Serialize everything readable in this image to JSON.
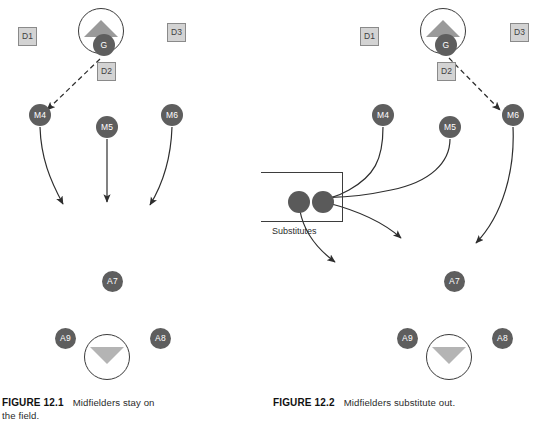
{
  "document": {
    "kind": "textbook-figure-pair",
    "colors": {
      "player_fill": "#5e5e5e",
      "player_text": "#ffffff",
      "dbox_fill": "#d3d3d3",
      "dbox_border": "#8a8a8a",
      "goal_outline": "#3b3b3b",
      "triangle_fill": "#9a9a9a",
      "arrow_stroke": "#2e2e2e",
      "background": "#ffffff"
    }
  },
  "figures": [
    {
      "id": "figure-12-1",
      "caption_number": "FIGURE 12.1",
      "caption_text": "Midfielders stay on",
      "caption_text_line2": "the field.",
      "defenders": [
        {
          "label": "D1",
          "x": 18,
          "y": 27
        },
        {
          "label": "D2",
          "x": 97,
          "y": 62
        },
        {
          "label": "D3",
          "x": 167,
          "y": 23
        }
      ],
      "goals": [
        {
          "name": "top-goal",
          "x": 78,
          "y": 8,
          "direction": "up"
        },
        {
          "name": "bottom-goal",
          "x": 84,
          "y": 334,
          "direction": "down"
        }
      ],
      "players": [
        {
          "label": "G",
          "x": 93,
          "y": 34,
          "d": 22
        },
        {
          "label": "M4",
          "x": 29,
          "y": 104,
          "d": 22
        },
        {
          "label": "M5",
          "x": 96,
          "y": 116,
          "d": 22
        },
        {
          "label": "M6",
          "x": 161,
          "y": 104,
          "d": 22
        },
        {
          "label": "A7",
          "x": 102,
          "y": 271,
          "d": 21
        },
        {
          "label": "A9",
          "x": 55,
          "y": 328,
          "d": 21
        },
        {
          "label": "A8",
          "x": 150,
          "y": 328,
          "d": 21
        }
      ],
      "dashed_pass": {
        "from": "G",
        "to": "M4"
      },
      "movement_arrows": [
        {
          "from": "M4",
          "direction": "curve-down-right"
        },
        {
          "from": "M5",
          "direction": "straight-down"
        },
        {
          "from": "M6",
          "direction": "curve-down-left"
        }
      ],
      "substitutes_box": null
    },
    {
      "id": "figure-12-2",
      "caption_number": "FIGURE 12.2",
      "caption_text": "Midfielders substitute out.",
      "caption_text_line2": "",
      "defenders": [
        {
          "label": "D1",
          "x": 89,
          "y": 27
        },
        {
          "label": "D2",
          "x": 166,
          "y": 62
        },
        {
          "label": "D3",
          "x": 239,
          "y": 23
        }
      ],
      "goals": [
        {
          "name": "top-goal",
          "x": 149,
          "y": 8,
          "direction": "up"
        },
        {
          "name": "bottom-goal",
          "x": 155,
          "y": 334,
          "direction": "down"
        }
      ],
      "players": [
        {
          "label": "G",
          "x": 164,
          "y": 34,
          "d": 22
        },
        {
          "label": "M4",
          "x": 101,
          "y": 104,
          "d": 22
        },
        {
          "label": "M5",
          "x": 168,
          "y": 116,
          "d": 22
        },
        {
          "label": "M6",
          "x": 231,
          "y": 104,
          "d": 22
        },
        {
          "label": "A7",
          "x": 173,
          "y": 271,
          "d": 21
        },
        {
          "label": "A9",
          "x": 126,
          "y": 328,
          "d": 21
        },
        {
          "label": "A8",
          "x": 221,
          "y": 328,
          "d": 21
        }
      ],
      "substitute_players": [
        {
          "label": "",
          "x": 17,
          "y": 191,
          "d": 22
        },
        {
          "label": "",
          "x": 41,
          "y": 191,
          "d": 22
        }
      ],
      "dashed_pass": {
        "from": "G",
        "to": "M6"
      },
      "movement_arrows": [
        {
          "from": "M4",
          "direction": "curve-left-to-bench"
        },
        {
          "from": "M5",
          "direction": "curve-left-to-bench"
        },
        {
          "from": "M6",
          "direction": "curve-down-left"
        },
        {
          "from": "sub-1",
          "direction": "curve-right-onto-field"
        },
        {
          "from": "sub-2",
          "direction": "curve-right-onto-field"
        }
      ],
      "substitutes_box": {
        "label": "Substitutes",
        "x": -10,
        "y": 172,
        "width": 82,
        "height": 50,
        "label_x": 1,
        "label_y": 227
      }
    }
  ]
}
